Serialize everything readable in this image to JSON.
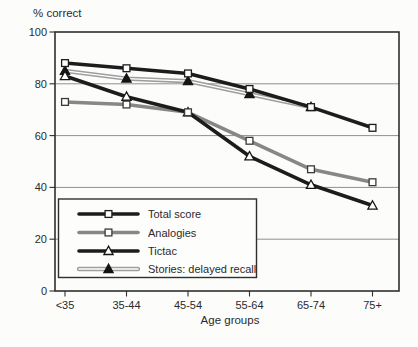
{
  "figure": {
    "y_units_label": "% correct",
    "x_axis_label": "Age groups"
  },
  "chart_data": {
    "type": "line",
    "title": "",
    "ylabel": "% correct",
    "xlabel": "Age groups",
    "categories": [
      "<35",
      "35-44",
      "45-54",
      "55-64",
      "65-74",
      "75+"
    ],
    "ylim": [
      0,
      100
    ],
    "yticks": [
      0,
      20,
      40,
      60,
      80,
      100
    ],
    "grid": "horizontal",
    "legend_position": "inside-bottom-left",
    "colors": {
      "black_line": "#1c1c1c",
      "gray_line": "#878787",
      "light_gray_line": "#9e9e9e",
      "gridline": "#909090",
      "frame": "#2f2f2f",
      "text": "#2b2b2b"
    },
    "series": [
      {
        "name": "Total score",
        "marker": "open-square",
        "color": "#1c1c1c",
        "line": "solid",
        "values": [
          88,
          86,
          84,
          78,
          71,
          63
        ]
      },
      {
        "name": "Analogies",
        "marker": "open-square",
        "color": "#878787",
        "line": "solid",
        "values": [
          73,
          72,
          69,
          58,
          47,
          42
        ]
      },
      {
        "name": "Tictac",
        "marker": "open-triangle",
        "color": "#1c1c1c",
        "line": "solid",
        "values": [
          83,
          75,
          69,
          52,
          41,
          33
        ]
      },
      {
        "name": "Stories: delayed recall",
        "marker": "filled-triangle",
        "color": "#9e9e9e",
        "line": "double",
        "values": [
          85,
          82,
          81,
          76,
          71,
          null
        ]
      }
    ]
  }
}
